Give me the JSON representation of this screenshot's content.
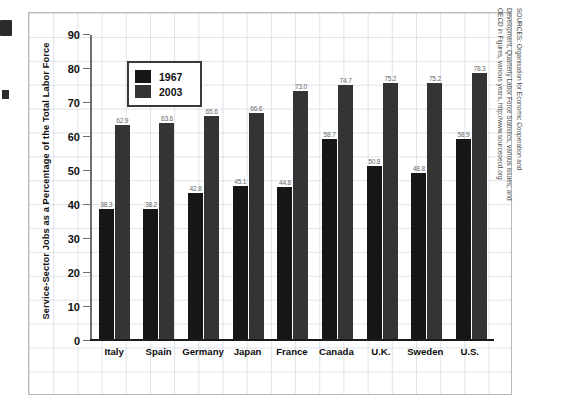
{
  "chart_data": {
    "type": "bar",
    "title": "",
    "xlabel": "",
    "ylabel": "Service-Sector Jobs as a Percentage of the Total Labor Force",
    "ylim": [
      0,
      90
    ],
    "ytick_labels": [
      "90",
      "80",
      "70",
      "60",
      "50",
      "40",
      "30",
      "20",
      "10",
      "0"
    ],
    "yticks": [
      90,
      80,
      70,
      60,
      50,
      40,
      30,
      20,
      10,
      0
    ],
    "grid": true,
    "legend_position": "upper-left",
    "categories": [
      "Italy",
      "Spain",
      "Germany",
      "Japan",
      "France",
      "Canada",
      "U.K.",
      "Sweden",
      "U.S."
    ],
    "series": [
      {
        "name": "1967",
        "color": "#161616",
        "values": [
          38.3,
          38.2,
          42.8,
          45.1,
          44.8,
          58.7,
          50.8,
          48.8,
          58.9
        ]
      },
      {
        "name": "2003",
        "color": "#343434",
        "values": [
          62.9,
          63.6,
          65.6,
          66.6,
          73.0,
          74.7,
          75.2,
          75.2,
          78.3
        ]
      }
    ]
  },
  "legend": {
    "entries": [
      {
        "label": "1967",
        "swatch": "#161616"
      },
      {
        "label": "2003",
        "swatch": "#343434"
      }
    ]
  },
  "source": {
    "line1": "SOURCES: Organisation for Economic Cooperation and Development, Quarterly Labor Force Statistics, various issues; and",
    "line2": "OECD in Figures, various years, http://www.sourceoecd.org"
  }
}
